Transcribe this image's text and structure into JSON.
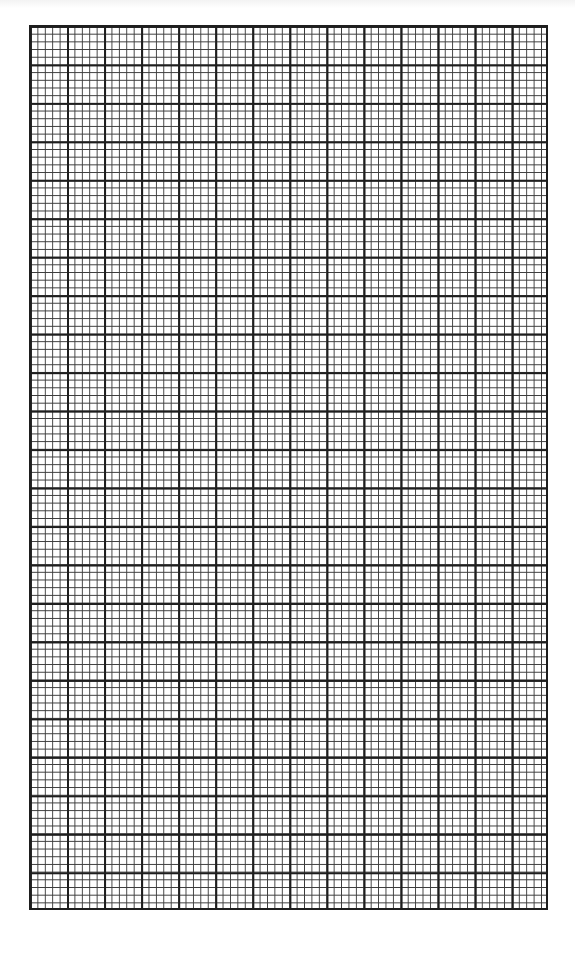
{
  "document": {
    "type": "graph-paper",
    "grid": {
      "major_columns": 14,
      "major_rows": 23,
      "minor_per_major": 5,
      "major_line_color": "#1e1e1e",
      "minor_line_color": "#3a3a3a",
      "background_color": "#ffffff"
    }
  }
}
